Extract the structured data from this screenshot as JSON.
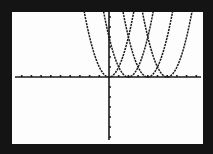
{
  "chart_data": {
    "type": "line",
    "title": "",
    "xlabel": "",
    "ylabel": "",
    "xlim": [
      -10,
      10
    ],
    "ylim": [
      -6.5,
      6.5
    ],
    "x_tick_step": 1,
    "y_tick_step": 1,
    "grid": false,
    "legend": "none",
    "colors": {
      "screen": "#fdfdfd",
      "frame": "#141414",
      "ink": "#1a1a1a"
    },
    "series": [
      {
        "name": "y = x^2",
        "equation": "x^2",
        "vertex": [
          0,
          0
        ]
      },
      {
        "name": "y = (x-2)^2",
        "equation": "(x-2)^2",
        "vertex": [
          2,
          0
        ]
      },
      {
        "name": "y = (x-4)^2",
        "equation": "(x-4)^2",
        "vertex": [
          4,
          0
        ]
      },
      {
        "name": "y = (x-6)^2",
        "equation": "(x-6)^2",
        "vertex": [
          6,
          0
        ]
      }
    ]
  }
}
